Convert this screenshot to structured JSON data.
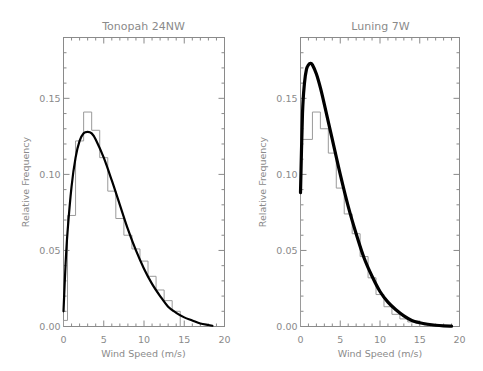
{
  "chart_data": [
    {
      "type": "bar",
      "title": "Tonopah 24NW",
      "xlabel": "Wind Speed (m/s)",
      "ylabel": "Relative Frequency",
      "xlim": [
        0,
        20
      ],
      "ylim": [
        0,
        0.19
      ],
      "xticks": [
        "0",
        "5",
        "10",
        "15",
        "20"
      ],
      "yticks": [
        "0.00",
        "0.05",
        "0.10",
        "0.15"
      ],
      "grid": false,
      "series": [
        {
          "name": "Observed histogram",
          "style": "step",
          "bin_edges": [
            0,
            0.5,
            1.5,
            2.5,
            3.5,
            4.5,
            5.5,
            6.5,
            7.5,
            8.5,
            9.5,
            10.5,
            11.5,
            12.5,
            13.5,
            14.5
          ],
          "values": [
            0.004,
            0.073,
            0.122,
            0.141,
            0.129,
            0.111,
            0.089,
            0.071,
            0.06,
            0.051,
            0.043,
            0.033,
            0.024,
            0.017,
            0.01
          ]
        },
        {
          "name": "Weibull fit",
          "style": "line",
          "x": [
            0,
            0.25,
            0.5,
            1,
            1.5,
            2,
            2.5,
            3,
            3.5,
            4,
            5,
            6,
            7,
            8,
            9,
            10,
            11,
            12,
            13,
            14,
            15,
            16,
            17,
            18,
            18.5
          ],
          "y": [
            0.01,
            0.04,
            0.062,
            0.092,
            0.111,
            0.122,
            0.127,
            0.128,
            0.127,
            0.123,
            0.111,
            0.096,
            0.08,
            0.064,
            0.05,
            0.038,
            0.028,
            0.02,
            0.013,
            0.009,
            0.006,
            0.004,
            0.002,
            0.001,
            0.0005
          ]
        }
      ]
    },
    {
      "type": "bar",
      "title": "Luning 7W",
      "xlabel": "Wind Speed (m/s)",
      "ylabel": "Relative Frequency",
      "xlim": [
        0,
        20
      ],
      "ylim": [
        0,
        0.19
      ],
      "xticks": [
        "0",
        "5",
        "10",
        "15",
        "20"
      ],
      "yticks": [
        "0.00",
        "0.05",
        "0.10",
        "0.15"
      ],
      "grid": false,
      "series": [
        {
          "name": "Observed histogram",
          "style": "step",
          "bin_edges": [
            0,
            1.5,
            2.5,
            3.5,
            4.5,
            5.5,
            6.5,
            7.5,
            8.5,
            9.5,
            10.5,
            11.5,
            12.5,
            13.5,
            14.5,
            15.5,
            16.5
          ],
          "values": [
            0.123,
            0.141,
            0.13,
            0.114,
            0.091,
            0.074,
            0.061,
            0.046,
            0.032,
            0.021,
            0.013,
            0.008,
            0.005,
            0.003,
            0.002,
            0.001
          ]
        },
        {
          "name": "Weibull fit",
          "style": "line",
          "x": [
            0,
            0.25,
            0.5,
            0.75,
            1,
            1.25,
            1.5,
            2,
            2.5,
            3,
            4,
            5,
            6,
            7,
            8,
            9,
            10,
            11,
            12,
            13,
            14,
            15,
            16,
            17,
            18,
            19
          ],
          "y": [
            0.088,
            0.14,
            0.16,
            0.169,
            0.172,
            0.173,
            0.172,
            0.166,
            0.157,
            0.146,
            0.123,
            0.1,
            0.079,
            0.061,
            0.045,
            0.033,
            0.023,
            0.016,
            0.011,
            0.007,
            0.004,
            0.0025,
            0.0015,
            0.0008,
            0.0004,
            0.0002
          ]
        }
      ]
    }
  ]
}
